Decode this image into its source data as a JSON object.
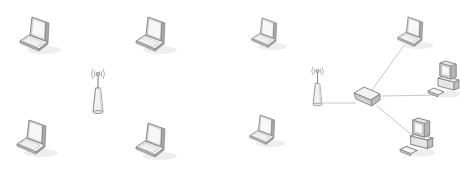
{
  "diagram": {
    "type": "network-topology",
    "background": "#ffffff",
    "colors": {
      "outline": "#8a8a8a",
      "fill_light": "#f4f4f4",
      "fill_mid": "#dedede",
      "fill_dark": "#c4c4c4",
      "link": "#c8c8c8",
      "shadow": "#ececec"
    },
    "panels": [
      {
        "name": "ad-hoc-network",
        "nodes": [
          {
            "kind": "laptop",
            "icon": "laptop-icon",
            "x": 18,
            "y": 14
          },
          {
            "kind": "laptop",
            "icon": "laptop-icon",
            "x": 134,
            "y": 14
          },
          {
            "kind": "laptop",
            "icon": "laptop-icon",
            "x": 15,
            "y": 117
          },
          {
            "kind": "laptop",
            "icon": "laptop-icon",
            "x": 134,
            "y": 120
          },
          {
            "kind": "wireless-access-point",
            "icon": "antenna-icon",
            "x": 90,
            "y": 66
          }
        ],
        "links": []
      },
      {
        "name": "infrastructure-network",
        "nodes": [
          {
            "kind": "laptop",
            "icon": "laptop-icon",
            "x": 250,
            "y": 15
          },
          {
            "kind": "laptop",
            "icon": "laptop-icon",
            "x": 248,
            "y": 112
          },
          {
            "kind": "laptop",
            "icon": "laptop-icon",
            "x": 396,
            "y": 14
          },
          {
            "kind": "wireless-access-point",
            "icon": "antenna-icon",
            "x": 310,
            "y": 64
          },
          {
            "kind": "switch",
            "icon": "switch-icon",
            "x": 352,
            "y": 84
          },
          {
            "kind": "desktop",
            "icon": "desktop-icon",
            "x": 426,
            "y": 60
          },
          {
            "kind": "desktop",
            "icon": "desktop-icon",
            "x": 398,
            "y": 117
          }
        ],
        "links": [
          {
            "from": [
              322,
              103
            ],
            "to": [
              356,
              103
            ]
          },
          {
            "from": [
              372,
              90
            ],
            "to": [
              405,
              44
            ]
          },
          {
            "from": [
              381,
              96
            ],
            "to": [
              440,
              95
            ]
          },
          {
            "from": [
              377,
              106
            ],
            "to": [
              412,
              135
            ]
          }
        ]
      }
    ]
  }
}
